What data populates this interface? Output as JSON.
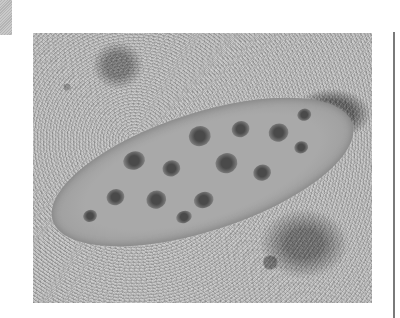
{
  "page": {
    "type": "scanned-book-page",
    "photo": {
      "subject": "flatfish camouflaged on sandy seabed",
      "icon": "photo-image",
      "tone": "grayscale"
    },
    "colors": {
      "background": "#ffffff",
      "sand": "#b5b5b5",
      "fish_body": "#a9a9a9",
      "spots": "#4a4a4a",
      "rule": "#7a7a7a",
      "corner_tab": "#bdbdbd"
    }
  }
}
